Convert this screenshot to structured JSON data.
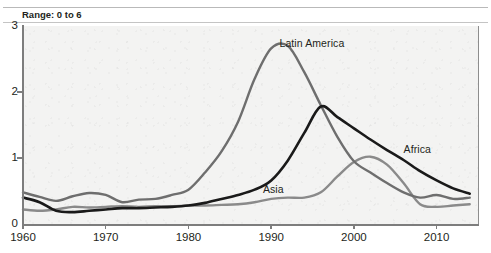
{
  "page": {
    "clipped_header_text": "",
    "range_note": "Range: 0 to 6"
  },
  "chart_data": {
    "type": "line",
    "title": "",
    "subtitle": "",
    "xlabel": "",
    "ylabel": "",
    "xlim": [
      1960,
      2015
    ],
    "ylim": [
      0,
      3
    ],
    "yticks": [
      0,
      1,
      2,
      3
    ],
    "xticks": [
      1960,
      1970,
      1980,
      1990,
      2000,
      2010
    ],
    "ytick_labels": [
      "0",
      "1",
      "2",
      "3"
    ],
    "xtick_labels": [
      "1960",
      "1970",
      "1980",
      "1990",
      "2000",
      "2010"
    ],
    "grid": false,
    "legend_position": "inline-annotations",
    "annotations": [
      {
        "text": "Range: 0 to 6",
        "position": "above-plot-left"
      }
    ],
    "series": [
      {
        "name": "Latin America",
        "color": "#6e6e6e",
        "label_x": 1991,
        "label_y": 2.72,
        "x": [
          1960,
          1962,
          1964,
          1966,
          1968,
          1970,
          1972,
          1974,
          1976,
          1978,
          1980,
          1982,
          1984,
          1986,
          1988,
          1990,
          1992,
          1994,
          1996,
          1998,
          2000,
          2002,
          2004,
          2006,
          2008,
          2010,
          2012,
          2014
        ],
        "values": [
          0.48,
          0.41,
          0.35,
          0.42,
          0.47,
          0.44,
          0.33,
          0.37,
          0.38,
          0.44,
          0.52,
          0.78,
          1.1,
          1.55,
          2.2,
          2.66,
          2.7,
          2.3,
          1.8,
          1.32,
          0.95,
          0.78,
          0.62,
          0.48,
          0.4,
          0.44,
          0.38,
          0.4
        ]
      },
      {
        "name": "Africa",
        "color": "#1a1a1a",
        "label_x": 2006,
        "label_y": 1.12,
        "x": [
          1960,
          1962,
          1964,
          1966,
          1968,
          1970,
          1972,
          1974,
          1976,
          1978,
          1980,
          1982,
          1984,
          1986,
          1988,
          1990,
          1992,
          1994,
          1996,
          1998,
          2000,
          2002,
          2004,
          2006,
          2008,
          2010,
          2012,
          2014
        ],
        "values": [
          0.4,
          0.33,
          0.2,
          0.18,
          0.2,
          0.22,
          0.24,
          0.24,
          0.25,
          0.26,
          0.28,
          0.32,
          0.38,
          0.44,
          0.52,
          0.66,
          0.96,
          1.38,
          1.78,
          1.62,
          1.45,
          1.28,
          1.12,
          0.97,
          0.8,
          0.66,
          0.54,
          0.46
        ]
      },
      {
        "name": "Asia",
        "color": "#8a8a8a",
        "label_x": 1989,
        "label_y": 0.52,
        "x": [
          1960,
          1962,
          1964,
          1966,
          1968,
          1970,
          1972,
          1974,
          1976,
          1978,
          1980,
          1982,
          1984,
          1986,
          1988,
          1990,
          1992,
          1994,
          1996,
          1998,
          2000,
          2002,
          2004,
          2006,
          2008,
          2010,
          2012,
          2014
        ],
        "values": [
          0.22,
          0.2,
          0.22,
          0.26,
          0.25,
          0.26,
          0.27,
          0.26,
          0.27,
          0.27,
          0.28,
          0.28,
          0.29,
          0.3,
          0.33,
          0.38,
          0.4,
          0.4,
          0.48,
          0.72,
          0.94,
          1.02,
          0.9,
          0.62,
          0.3,
          0.26,
          0.28,
          0.3
        ]
      }
    ]
  }
}
